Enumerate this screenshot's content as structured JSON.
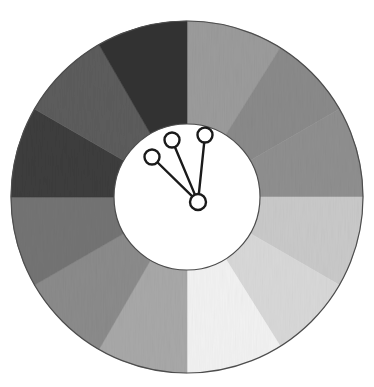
{
  "figure": {
    "type": "donut-wheel-diagram",
    "background_color": "#ffffff",
    "width": 374,
    "height": 387
  },
  "chart_data": {
    "type": "pie",
    "title": "Grayscale segmented donut wheel",
    "xlabel": "",
    "ylabel": "",
    "legend_position": "none",
    "grid": false,
    "center": {
      "x": 187,
      "y": 197
    },
    "outer_radius": 176,
    "inner_radius": 73,
    "ring_stroke_color": "#4d4d4d",
    "ring_stroke_width": 1.2,
    "inner_circle_fill": "#ffffff",
    "categories": [
      "seg-01",
      "seg-02",
      "seg-03",
      "seg-04",
      "seg-05",
      "seg-06",
      "seg-07",
      "seg-08",
      "seg-09",
      "seg-10",
      "seg-11",
      "seg-12"
    ],
    "values": [
      32,
      28,
      30,
      30,
      28,
      32,
      30,
      30,
      30,
      30,
      30,
      30
    ],
    "segments": [
      {
        "name": "seg-01",
        "start_deg": 0,
        "end_deg": 32,
        "fill": "#9b9b9b",
        "shade_label": "mid-light gray"
      },
      {
        "name": "seg-02",
        "start_deg": 32,
        "end_deg": 60,
        "fill": "#8a8a8a",
        "shade_label": "mid gray"
      },
      {
        "name": "seg-03",
        "start_deg": 60,
        "end_deg": 90,
        "fill": "#8f8f8f",
        "shade_label": "mid gray"
      },
      {
        "name": "seg-04",
        "start_deg": 90,
        "end_deg": 120,
        "fill": "#c9c9c9",
        "shade_label": "light gray"
      },
      {
        "name": "seg-05",
        "start_deg": 120,
        "end_deg": 148,
        "fill": "#d8d8d8",
        "shade_label": "lighter gray"
      },
      {
        "name": "seg-06",
        "start_deg": 148,
        "end_deg": 180,
        "fill": "#f2f2f2",
        "shade_label": "near white"
      },
      {
        "name": "seg-07",
        "start_deg": 180,
        "end_deg": 210,
        "fill": "#a8a8a8",
        "shade_label": "mid-light gray"
      },
      {
        "name": "seg-08",
        "start_deg": 210,
        "end_deg": 240,
        "fill": "#8b8b8b",
        "shade_label": "mid gray"
      },
      {
        "name": "seg-09",
        "start_deg": 240,
        "end_deg": 270,
        "fill": "#747474",
        "shade_label": "dark-mid gray"
      },
      {
        "name": "seg-10",
        "start_deg": 270,
        "end_deg": 300,
        "fill": "#3d3d3d",
        "shade_label": "very dark gray"
      },
      {
        "name": "seg-11",
        "start_deg": 300,
        "end_deg": 330,
        "fill": "#5c5c5c",
        "shade_label": "dark gray"
      },
      {
        "name": "seg-12",
        "start_deg": 330,
        "end_deg": 360,
        "fill": "#333333",
        "shade_label": "darkest gray"
      }
    ],
    "indicator": {
      "name": "three-spoke-indicator",
      "hub": {
        "x": 198,
        "y": 202,
        "radius": 8
      },
      "stroke_color": "#1a1a1a",
      "stroke_width": 2.4,
      "node_fill": "#ffffff",
      "nodes": [
        {
          "name": "spoke-node-left",
          "x": 152,
          "y": 157,
          "radius": 7.5
        },
        {
          "name": "spoke-node-middle",
          "x": 172,
          "y": 140,
          "radius": 7.5
        },
        {
          "name": "spoke-node-right",
          "x": 205,
          "y": 135,
          "radius": 7.5
        }
      ]
    }
  }
}
